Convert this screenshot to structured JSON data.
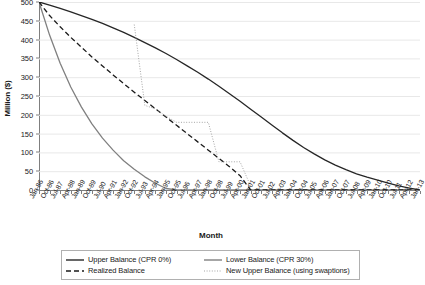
{
  "chart_data": {
    "type": "line",
    "title": "",
    "xlabel": "Month",
    "ylabel": "Million ($)",
    "ylim": [
      0,
      500
    ],
    "ytick_step": 50,
    "yticks": [
      0,
      50,
      100,
      150,
      200,
      250,
      300,
      350,
      400,
      450,
      500
    ],
    "grid": "horizontal",
    "legend_position": "bottom",
    "x": [
      "Jan-86",
      "Oct-86",
      "Jul-87",
      "Apr-88",
      "Jan-89",
      "Oct-89",
      "Jul-90",
      "Apr-91",
      "Jan-92",
      "Oct-92",
      "Jul-93",
      "Apr-94",
      "Jan-95",
      "Oct-95",
      "Jul-96",
      "Apr-97",
      "Jan-98",
      "Oct-98",
      "Jul-99",
      "Apr-00",
      "Jan-01",
      "Oct-01",
      "Jul-02",
      "Apr-03",
      "Jan-04",
      "Oct-04",
      "Jul-05",
      "Apr-06",
      "Jan-07",
      "Oct-07",
      "Jul-08",
      "Apr-09",
      "Jan-10",
      "Oct-10",
      "Jul-11",
      "Apr-12",
      "Jan-13"
    ],
    "series": [
      {
        "name": "Upper Balance (CPR 0%)",
        "style": "solid",
        "color": "#262626",
        "values": [
          500,
          492,
          483,
          474,
          464,
          454,
          443,
          431,
          419,
          406,
          392,
          378,
          363,
          347,
          330,
          313,
          295,
          276,
          256,
          236,
          215,
          194,
          173,
          152,
          132,
          113,
          96,
          80,
          66,
          54,
          43,
          34,
          26,
          18,
          11,
          5,
          0
        ]
      },
      {
        "name": "Lower Balance (CPR 30%)",
        "style": "solid",
        "color": "#808080",
        "values": [
          500,
          412,
          337,
          274,
          221,
          176,
          138,
          106,
          78,
          55,
          35,
          18,
          4,
          0,
          0,
          0,
          0,
          0,
          0,
          0,
          0,
          0,
          0,
          0,
          0,
          0,
          0,
          0,
          0,
          0,
          0,
          0,
          0,
          0,
          0,
          0,
          0
        ]
      },
      {
        "name": "Realized Balance",
        "style": "dashed",
        "color": "#1a1a1a",
        "values": [
          500,
          464,
          434,
          406,
          380,
          354,
          330,
          306,
          283,
          260,
          238,
          216,
          194,
          172,
          150,
          128,
          106,
          84,
          62,
          38,
          0,
          0,
          0,
          0,
          0,
          0,
          0,
          0,
          0,
          0,
          0,
          0,
          0,
          0,
          0,
          0,
          0
        ]
      },
      {
        "name": "New Upper Balance (using swaptions)",
        "style": "dotted",
        "color": "#a6a6a6",
        "values": [
          null,
          null,
          null,
          null,
          null,
          null,
          null,
          null,
          null,
          440,
          225,
          216,
          196,
          180,
          180,
          180,
          180,
          75,
          75,
          75,
          10,
          null,
          null,
          null,
          null,
          null,
          null,
          null,
          null,
          null,
          null,
          null,
          null,
          null,
          null,
          null,
          null
        ]
      }
    ]
  },
  "legend": {
    "items": [
      {
        "label": "Upper Balance (CPR 0%)",
        "style": "solid",
        "color": "#262626"
      },
      {
        "label": "Lower Balance (CPR 30%)",
        "style": "solid",
        "color": "#808080"
      },
      {
        "label": "Realized Balance",
        "style": "dashed",
        "color": "#1a1a1a"
      },
      {
        "label": "New Upper Balance (using swaptions)",
        "style": "dotted",
        "color": "#a6a6a6"
      }
    ]
  },
  "colors": {
    "gridline": "#e8e8e8",
    "axis": "#7f7f7f",
    "text": "#1a1a1a",
    "legend_border": "#b0b0b0"
  }
}
